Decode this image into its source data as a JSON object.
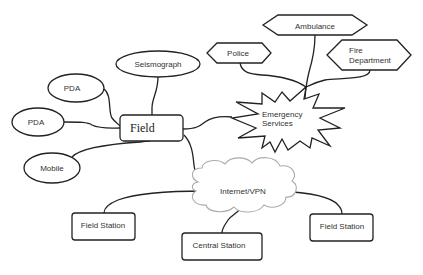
{
  "diagram": {
    "type": "network-topology",
    "nodes": {
      "field": {
        "label": "Field",
        "shape": "rounded-rect"
      },
      "seismograph": {
        "label": "Seismograph",
        "shape": "ellipse"
      },
      "pda_upper": {
        "label": "PDA",
        "shape": "ellipse"
      },
      "pda_lower": {
        "label": "PDA",
        "shape": "ellipse"
      },
      "mobile": {
        "label": "Mobile",
        "shape": "ellipse"
      },
      "emergency": {
        "label_line1": "Emergency",
        "label_line2": "Services",
        "shape": "explosion-star"
      },
      "police": {
        "label": "Police",
        "shape": "hexagon"
      },
      "ambulance": {
        "label": "Ambulance",
        "shape": "hexagon"
      },
      "fire": {
        "label_line1": "Fire",
        "label_line2": "Department",
        "shape": "hexagon"
      },
      "internet": {
        "label": "Internet/VPN",
        "shape": "cloud"
      },
      "field_station_left": {
        "label": "Field Station",
        "shape": "rounded-rect"
      },
      "central_station": {
        "label": "Central Station",
        "shape": "rounded-rect"
      },
      "field_station_right": {
        "label": "Field Station",
        "shape": "rounded-rect"
      }
    },
    "edges": [
      [
        "seismograph",
        "field"
      ],
      [
        "pda_upper",
        "field"
      ],
      [
        "pda_lower",
        "field"
      ],
      [
        "mobile",
        "field"
      ],
      [
        "field",
        "emergency"
      ],
      [
        "field",
        "internet"
      ],
      [
        "emergency",
        "police"
      ],
      [
        "emergency",
        "ambulance"
      ],
      [
        "emergency",
        "fire"
      ],
      [
        "internet",
        "field_station_left"
      ],
      [
        "internet",
        "central_station"
      ],
      [
        "internet",
        "field_station_right"
      ]
    ],
    "colors": {
      "stroke": "#222222",
      "cloud_stroke": "#aaaaaa",
      "background": "#ffffff",
      "text": "#333333"
    }
  }
}
